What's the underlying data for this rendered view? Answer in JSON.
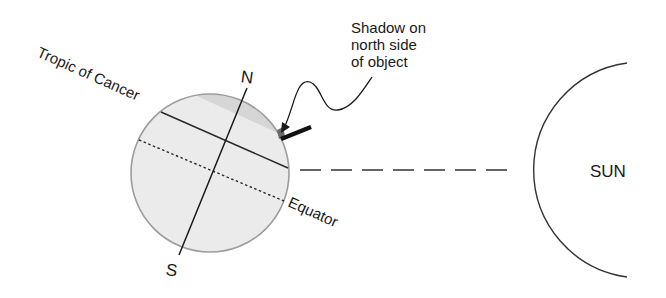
{
  "diagram": {
    "title": "",
    "earth": {
      "north_label": "N",
      "south_label": "S",
      "tropic_label": "Tropic of Cancer",
      "equator_label": "Equator",
      "colors": {
        "north_of_tropic_fill": "#d6d6d6",
        "south_fill": "#ebebeb",
        "outline": "#9c9c9c",
        "lines": "#2a2a2a"
      }
    },
    "callout": {
      "lines": [
        "Shadow on",
        "north side",
        "of object"
      ]
    },
    "sun": {
      "label": "SUN"
    },
    "sunlight_ray": {
      "style": "dashed"
    }
  }
}
